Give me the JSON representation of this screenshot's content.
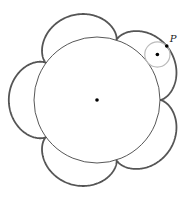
{
  "diagram": {
    "type": "epicycloid",
    "cusps": 5,
    "center": [
      97,
      100
    ],
    "fixed_circle_radius": 63,
    "rolling_circle_radius": 12.6,
    "rolling_circle_angle_deg": -37,
    "point_label": "P",
    "colors": {
      "curve": "#555555",
      "fixed_circle": "#444444",
      "rolling_circle": "#bbbbbb",
      "dot": "#000000"
    }
  }
}
